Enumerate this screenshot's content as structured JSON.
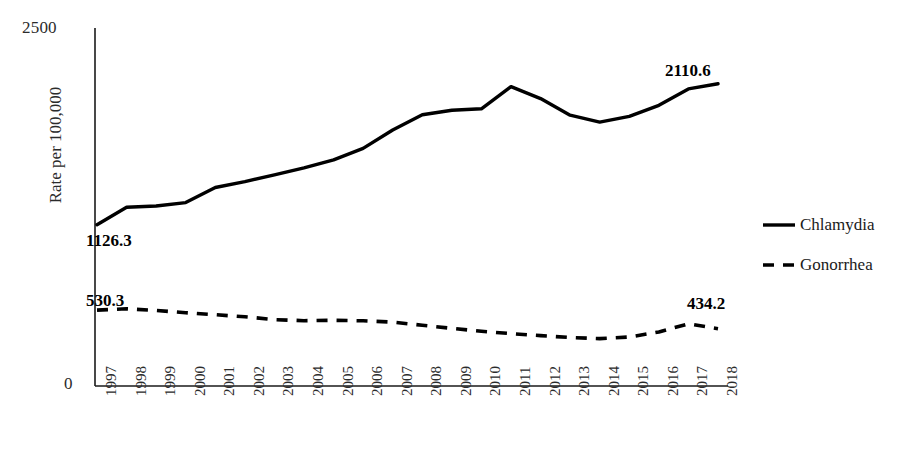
{
  "chart_data": {
    "type": "line",
    "title": "",
    "xlabel": "",
    "ylabel": "Rate per 100,000",
    "ylim": [
      0,
      2500
    ],
    "yticks": [
      "0",
      "2500"
    ],
    "grid": false,
    "legend_position": "right",
    "x": [
      "1997",
      "1998",
      "1999",
      "2000",
      "2001",
      "2002",
      "2003",
      "2004",
      "2005",
      "2006",
      "2007",
      "2008",
      "2009",
      "2010",
      "2011",
      "2012",
      "2013",
      "2014",
      "2015",
      "2016",
      "2017",
      "2018"
    ],
    "series": [
      {
        "name": "Chlamydia",
        "style": "solid",
        "color": "#000000",
        "values": [
          1126.3,
          1248.0,
          1257.0,
          1281.0,
          1386.0,
          1427.0,
          1475.0,
          1523.0,
          1579.0,
          1659.0,
          1788.0,
          1894.0,
          1925.0,
          1936.0,
          2091.0,
          2007.0,
          1891.0,
          1843.0,
          1883.0,
          1960.0,
          2075.0,
          2110.6
        ]
      },
      {
        "name": "Gonorrhea",
        "style": "dashed",
        "color": "#000000",
        "values": [
          530.3,
          539.0,
          527.0,
          512.0,
          498.0,
          483.0,
          464.0,
          456.0,
          459.0,
          455.0,
          446.0,
          424.0,
          402.0,
          382.0,
          366.0,
          352.0,
          339.0,
          331.0,
          342.0,
          377.0,
          434.2,
          400.0
        ]
      }
    ],
    "data_labels": [
      {
        "series": "Chlamydia",
        "x": "1997",
        "text": "1126.3"
      },
      {
        "series": "Chlamydia",
        "x": "2018",
        "text": "2110.6"
      },
      {
        "series": "Gonorrhea",
        "x": "1997",
        "text": "530.3"
      },
      {
        "series": "Gonorrhea",
        "x": "2017",
        "text": "434.2"
      }
    ],
    "axis_color": "#1a1a1a"
  }
}
